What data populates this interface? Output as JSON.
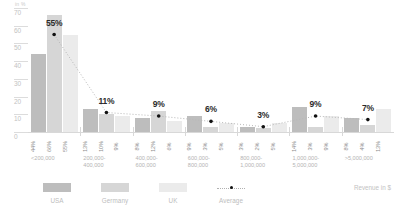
{
  "axis": {
    "unit_label": "in %",
    "y_ticks": [
      "70",
      "60",
      "50",
      "40",
      "30",
      "20",
      "10",
      "0"
    ],
    "x_title": "Revenue in $"
  },
  "legend": {
    "items": [
      {
        "label": "USA",
        "color": "#bdbdbd",
        "type": "swatch"
      },
      {
        "label": "Germany",
        "color": "#d6d6d6",
        "type": "swatch"
      },
      {
        "label": "UK",
        "color": "#ebebeb",
        "type": "swatch"
      },
      {
        "label": "Average",
        "color": "#111111",
        "type": "dotted-line"
      }
    ]
  },
  "chart_data": {
    "type": "bar",
    "title": "",
    "xlabel": "Revenue in $",
    "ylabel": "in %",
    "ylim": [
      0,
      70
    ],
    "grid": true,
    "legend_position": "bottom-left",
    "categories": [
      "<200,000",
      "200,000-\n400,000",
      "400,000-\n600,000",
      "600,000-\n800,000",
      "800,000-\n1,000,000",
      "1,000,000-\n5,000,000",
      ">5,000,000"
    ],
    "series": [
      {
        "name": "USA",
        "color": "#bdbdbd",
        "values": [
          44,
          13,
          8,
          9,
          3,
          14,
          8
        ]
      },
      {
        "name": "Germany",
        "color": "#d6d6d6",
        "values": [
          66,
          10,
          12,
          3,
          2,
          3,
          4
        ]
      },
      {
        "name": "UK",
        "color": "#ebebeb",
        "values": [
          55,
          9,
          6,
          5,
          5,
          9,
          13
        ]
      },
      {
        "name": "Average",
        "color": "#111111",
        "values": [
          55,
          11,
          9,
          6,
          3,
          9,
          7
        ],
        "render": "dotted-line-with-dots"
      }
    ],
    "group_labels": [
      "55%",
      "11%",
      "9%",
      "6%",
      "3%",
      "9%",
      "7%"
    ],
    "bar_value_labels": [
      [
        "44%",
        "66%",
        "55%"
      ],
      [
        "13%",
        "10%",
        "9%"
      ],
      [
        "8%",
        "12%",
        "6%"
      ],
      [
        "9%",
        "3%",
        "5%"
      ],
      [
        "3%",
        "2%",
        "5%"
      ],
      [
        "14%",
        "3%",
        "9%"
      ],
      [
        "8%",
        "4%",
        "13%"
      ]
    ]
  }
}
